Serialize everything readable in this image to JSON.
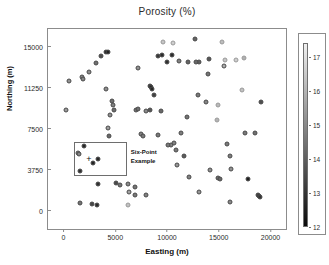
{
  "chart_data": {
    "type": "scatter",
    "title": "Porosity (%)",
    "xlabel": "Easting (m)",
    "ylabel": "Northing (m)",
    "xlim": [
      -1500,
      21500
    ],
    "ylim": [
      -1700,
      16600
    ],
    "xticks": [
      0,
      5000,
      10000,
      15000,
      20000
    ],
    "xticklabels": [
      "0",
      "5000",
      "10000",
      "15000",
      "20000"
    ],
    "yticks": [
      0,
      3750,
      7500,
      11250,
      15000
    ],
    "yticklabels": [
      "0",
      "3750",
      "7500",
      "11250",
      "15000"
    ],
    "grid": false,
    "legend": "none",
    "colorbar": {
      "orientation": "vertical",
      "position": "right",
      "vmin": 12,
      "vmax": 17.4,
      "ticks": [
        12,
        13,
        14,
        15,
        16,
        17
      ],
      "ticklabels": [
        "12",
        "13",
        "14",
        "15",
        "16",
        "17"
      ],
      "colormap": "grayscale_dark_low_to_light_high",
      "low_color": "#000000",
      "high_color": "#f2f2f2"
    },
    "marker": {
      "shape": "circle",
      "size_px": 5,
      "edge_color": "#555555"
    },
    "annotation": {
      "text": "Six-Point\nExample",
      "box_x": [
        1000,
        6100
      ],
      "box_y": [
        3150,
        6250
      ],
      "cross_marker": "+",
      "cross_x": 2450,
      "cross_y": 4700,
      "text_x": 6500,
      "text_y": 4850
    },
    "points": [
      {
        "x": 500,
        "y": 11850,
        "v": 15.2
      },
      {
        "x": 200,
        "y": 9200,
        "v": 15.4
      },
      {
        "x": 1750,
        "y": 12200,
        "v": 15.0
      },
      {
        "x": 1900,
        "y": 12050,
        "v": 14.9
      },
      {
        "x": 2450,
        "y": 12650,
        "v": 15.1
      },
      {
        "x": 3150,
        "y": 13500,
        "v": 14.4
      },
      {
        "x": 3600,
        "y": 14150,
        "v": 13.6
      },
      {
        "x": 4100,
        "y": 14450,
        "v": 12.6
      },
      {
        "x": 4300,
        "y": 14500,
        "v": 12.6
      },
      {
        "x": 4450,
        "y": 8700,
        "v": 15.2
      },
      {
        "x": 4100,
        "y": 11150,
        "v": 15.1
      },
      {
        "x": 4650,
        "y": 10050,
        "v": 14.4
      },
      {
        "x": 4800,
        "y": 9650,
        "v": 14.8
      },
      {
        "x": 4900,
        "y": 9200,
        "v": 14.3
      },
      {
        "x": 4250,
        "y": 7550,
        "v": 15.5
      },
      {
        "x": 4400,
        "y": 6850,
        "v": 14.2
      },
      {
        "x": 7200,
        "y": 13050,
        "v": 15.2
      },
      {
        "x": 7050,
        "y": 9200,
        "v": 14.5
      },
      {
        "x": 7150,
        "y": 9250,
        "v": 14.4
      },
      {
        "x": 8000,
        "y": 9100,
        "v": 15.0
      },
      {
        "x": 7450,
        "y": 6950,
        "v": 14.8
      },
      {
        "x": 7700,
        "y": 6800,
        "v": 14.6
      },
      {
        "x": 8350,
        "y": 11400,
        "v": 12.8
      },
      {
        "x": 8450,
        "y": 11250,
        "v": 12.7
      },
      {
        "x": 8550,
        "y": 11100,
        "v": 12.7
      },
      {
        "x": 8750,
        "y": 10550,
        "v": 13.3
      },
      {
        "x": 9100,
        "y": 14150,
        "v": 13.1
      },
      {
        "x": 9550,
        "y": 14200,
        "v": 12.8
      },
      {
        "x": 9450,
        "y": 9100,
        "v": 14.2
      },
      {
        "x": 9100,
        "y": 6900,
        "v": 14.6
      },
      {
        "x": 9600,
        "y": 15450,
        "v": 16.4
      },
      {
        "x": 10000,
        "y": 13600,
        "v": 12.9
      },
      {
        "x": 10450,
        "y": 14200,
        "v": 12.8
      },
      {
        "x": 10350,
        "y": 6000,
        "v": 14.9
      },
      {
        "x": 10050,
        "y": 5950,
        "v": 14.6
      },
      {
        "x": 10600,
        "y": 15350,
        "v": 16.6
      },
      {
        "x": 10700,
        "y": 6200,
        "v": 14.8
      },
      {
        "x": 10850,
        "y": 5500,
        "v": 14.6
      },
      {
        "x": 10950,
        "y": 4150,
        "v": 15.3
      },
      {
        "x": 11200,
        "y": 13650,
        "v": 14.8
      },
      {
        "x": 11400,
        "y": 7100,
        "v": 14.7
      },
      {
        "x": 11650,
        "y": 4950,
        "v": 13.9
      },
      {
        "x": 11900,
        "y": 8550,
        "v": 14.5
      },
      {
        "x": 12050,
        "y": 13600,
        "v": 14.1
      },
      {
        "x": 12100,
        "y": 3100,
        "v": 14.8
      },
      {
        "x": 12700,
        "y": 15650,
        "v": 14.1
      },
      {
        "x": 13050,
        "y": 13600,
        "v": 14.0
      },
      {
        "x": 12950,
        "y": 10550,
        "v": 14.6
      },
      {
        "x": 13100,
        "y": 1700,
        "v": 15.3
      },
      {
        "x": 13750,
        "y": 9900,
        "v": 14.9
      },
      {
        "x": 14000,
        "y": 12500,
        "v": 14.5
      },
      {
        "x": 14100,
        "y": 13850,
        "v": 13.8
      },
      {
        "x": 14200,
        "y": 3700,
        "v": 15.2
      },
      {
        "x": 14800,
        "y": 8250,
        "v": 16.0
      },
      {
        "x": 14900,
        "y": 9650,
        "v": 16.1
      },
      {
        "x": 14900,
        "y": 2950,
        "v": 14.3
      },
      {
        "x": 15150,
        "y": 2900,
        "v": 14.2
      },
      {
        "x": 15350,
        "y": 15450,
        "v": 16.2
      },
      {
        "x": 15500,
        "y": 13200,
        "v": 15.8
      },
      {
        "x": 15600,
        "y": 13750,
        "v": 16.4
      },
      {
        "x": 15750,
        "y": 6100,
        "v": 14.6
      },
      {
        "x": 16100,
        "y": 5000,
        "v": 14.7
      },
      {
        "x": 16200,
        "y": 3750,
        "v": 15.2
      },
      {
        "x": 16100,
        "y": 800,
        "v": 15.0
      },
      {
        "x": 16700,
        "y": 13800,
        "v": 16.6
      },
      {
        "x": 17200,
        "y": 11000,
        "v": 16.3
      },
      {
        "x": 17400,
        "y": 13950,
        "v": 15.9
      },
      {
        "x": 17550,
        "y": 7050,
        "v": 14.6
      },
      {
        "x": 17800,
        "y": 2900,
        "v": 12.5
      },
      {
        "x": 18500,
        "y": 7050,
        "v": 14.4
      },
      {
        "x": 18750,
        "y": 1450,
        "v": 13.1
      },
      {
        "x": 18850,
        "y": 1350,
        "v": 12.9
      },
      {
        "x": 18950,
        "y": 1250,
        "v": 13.0
      },
      {
        "x": 19100,
        "y": 9950,
        "v": 13.6
      },
      {
        "x": 6200,
        "y": 2450,
        "v": 15.0
      },
      {
        "x": 6350,
        "y": 1700,
        "v": 15.6
      },
      {
        "x": 6200,
        "y": 500,
        "v": 16.3
      },
      {
        "x": 6900,
        "y": 1450,
        "v": 14.6
      },
      {
        "x": 6900,
        "y": 2100,
        "v": 14.5
      },
      {
        "x": 7950,
        "y": 1450,
        "v": 14.8
      },
      {
        "x": 5100,
        "y": 2550,
        "v": 13.5
      },
      {
        "x": 5500,
        "y": 2300,
        "v": 14.5
      },
      {
        "x": 3300,
        "y": 2400,
        "v": 12.9
      },
      {
        "x": 1600,
        "y": 700,
        "v": 14.5
      },
      {
        "x": 2800,
        "y": 600,
        "v": 13.4
      },
      {
        "x": 3200,
        "y": 500,
        "v": 12.8
      },
      {
        "x": 1400,
        "y": 5250,
        "v": 15.0
      },
      {
        "x": 1500,
        "y": 5150,
        "v": 14.9
      },
      {
        "x": 2000,
        "y": 5900,
        "v": 12.7
      },
      {
        "x": 2850,
        "y": 4300,
        "v": 12.6
      },
      {
        "x": 3350,
        "y": 4750,
        "v": 12.7
      },
      {
        "x": 1550,
        "y": 3600,
        "v": 12.9
      },
      {
        "x": 8350,
        "y": 9150,
        "v": 13.8
      },
      {
        "x": 12850,
        "y": 13600,
        "v": 14.2
      }
    ]
  }
}
